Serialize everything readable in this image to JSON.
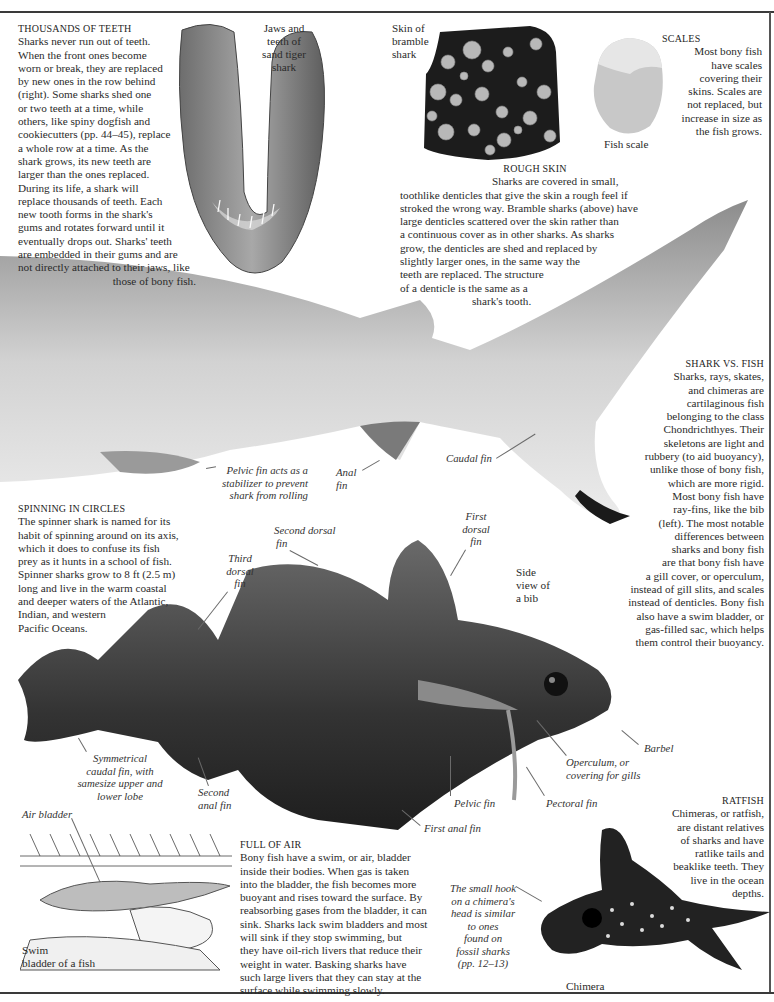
{
  "sections": {
    "teeth": {
      "heading": "THOUSANDS OF TEETH",
      "lines": [
        "Sharks never run out of teeth.",
        "When the front ones become",
        "worn or break, they are replaced",
        "by new ones in the row behind",
        "(right). Some sharks shed one",
        "or two teeth at a time, while",
        "others, like spiny dogfish and",
        "cookiecutters (pp. 44–45), replace",
        "a whole row at a time. As the",
        "shark grows, its new teeth are",
        "larger than the ones replaced.",
        "During its life, a shark will",
        "replace thousands of teeth. Each",
        "new tooth forms in the shark's",
        "gums and rotates forward until it",
        "eventually drops out. Sharks' teeth",
        "are embedded in their gums and are",
        "not directly attached to their jaws, like",
        "those of bony fish."
      ]
    },
    "rough_skin": {
      "heading": "ROUGH SKIN",
      "lines": [
        "Sharks are covered in small,",
        "toothlike denticles that give the skin a rough feel if",
        "stroked the wrong way. Bramble sharks (above) have",
        "large denticles scattered over the skin rather than",
        "a continuous cover as in other sharks. As sharks",
        "grow, the denticles are shed and replaced by",
        "slightly larger ones, in the same way the",
        "teeth are replaced. The structure",
        "of a denticle is the same as a",
        "shark's tooth."
      ]
    },
    "scales": {
      "heading": "SCALES",
      "lines": [
        "Most bony fish",
        "have scales",
        "covering their",
        "skins. Scales are",
        "not replaced, but",
        "increase in size as",
        "the fish grows."
      ]
    },
    "shark_vs_fish": {
      "heading": "SHARK VS. FISH",
      "lines": [
        "Sharks, rays, skates,",
        "and chimeras are",
        "cartilaginous fish",
        "belonging to the class",
        "Chondrichthyes. Their",
        "skeletons are light and",
        "rubbery (to aid buoyancy),",
        "unlike those of bony fish,",
        "which are more rigid.",
        "Most bony fish have",
        "ray-fins, like the bib",
        "(left). The most notable",
        "differences between",
        "sharks and bony fish",
        "are that bony fish have",
        "a gill cover, or operculum,",
        "instead of gill slits, and scales",
        "instead of denticles. Bony fish",
        "also have a swim bladder, or",
        "gas-filled sac, which helps",
        "them control their buoyancy."
      ]
    },
    "spinning": {
      "heading": "SPINNING IN CIRCLES",
      "lines": [
        "The spinner shark is named for its",
        "habit of spinning around on its axis,",
        "which it does to confuse its fish",
        "prey as it hunts in a school of fish.",
        "Spinner sharks grow to 8 ft (2.5 m)",
        "long and live in the warm coastal",
        "and deeper waters of the Atlantic,",
        "Indian, and western",
        "Pacific Oceans."
      ]
    },
    "full_of_air": {
      "heading": "FULL OF AIR",
      "lines": [
        "Bony fish have a swim, or air, bladder",
        "inside their bodies. When gas is taken",
        "into the bladder, the fish becomes more",
        "buoyant and rises toward the surface. By",
        "reabsorbing gases from the bladder, it can",
        "sink. Sharks lack swim bladders and most",
        "will sink if they stop swimming, but",
        "they have oil-rich livers that reduce their",
        "weight in water. Basking sharks have",
        "such large livers that they can stay at the",
        "surface while swimming slowly."
      ]
    },
    "ratfish": {
      "heading": "RATFISH",
      "lines": [
        "Chimeras, or ratfish,",
        "are distant relatives",
        "of sharks and have",
        "ratlike tails and",
        "beaklike teeth. They",
        "live in the ocean",
        "depths."
      ]
    }
  },
  "captions": {
    "jaws": [
      "Jaws and",
      "teeth of",
      "sand tiger",
      "shark"
    ],
    "bramble": [
      "Skin of",
      "bramble",
      "shark"
    ],
    "fish_scale": "Fish scale",
    "bib": [
      "Side",
      "view of",
      "a bib"
    ],
    "swim_bladder": [
      "Swim",
      "bladder of a fish"
    ],
    "chimera": "Chimera"
  },
  "labels": {
    "pelvic_fin_shark": [
      "Pelvic fin   acts as a",
      "stabilizer to prevent",
      "shark from rolling"
    ],
    "anal_fin": [
      "Anal",
      "fin"
    ],
    "caudal_fin": "Caudal fin",
    "second_dorsal": [
      "Second dorsal",
      "fin"
    ],
    "first_dorsal": [
      "First",
      "dorsal",
      "fin"
    ],
    "third_dorsal": [
      "Third",
      "dorsal",
      "fin"
    ],
    "symmetrical_caudal": [
      "Symmetrical",
      "caudal fin, with",
      "samesize upper and",
      "lower lobe"
    ],
    "second_anal": [
      "Second",
      "anal fin"
    ],
    "barbel": "Barbel",
    "operculum": [
      "Operculum, or",
      "covering for gills"
    ],
    "pelvic_fin_bib": "Pelvic fin",
    "pectoral_fin": "Pectoral fin",
    "first_anal": "First anal fin",
    "air_bladder": "Air bladder",
    "chimera_hook": [
      "The small hook",
      "on a chimera's",
      "head is similar",
      "to ones",
      "found on",
      "fossil sharks",
      "(pp. 12–13)"
    ]
  },
  "colors": {
    "text": "#2a2a2a",
    "rule": "#3a3a3a",
    "shark_light": "#d9d9d9",
    "shark_dark": "#7a7a7a",
    "fish_dark": "#3a3a3a",
    "skin_dark": "#1c1c1c",
    "denticle": "#b8b8b8"
  }
}
